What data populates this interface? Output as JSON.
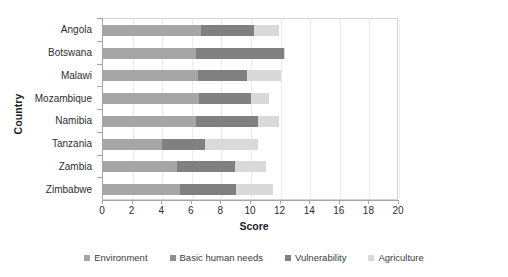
{
  "chart_data": {
    "type": "bar",
    "orientation": "horizontal",
    "stacked": true,
    "title": "",
    "xlabel": "Score",
    "ylabel": "Country",
    "xlim": [
      0,
      20
    ],
    "xticks": [
      0,
      2,
      4,
      6,
      8,
      10,
      12,
      14,
      16,
      18,
      20
    ],
    "grid": true,
    "legend_position": "bottom",
    "categories": [
      "Angola",
      "Botswana",
      "Malawi",
      "Mozambique",
      "Namibia",
      "Tanzania",
      "Zambia",
      "Zimbabwe"
    ],
    "series": [
      {
        "name": "Environment",
        "color": "#a6a6a6",
        "values": [
          6.6,
          6.3,
          6.4,
          6.5,
          6.3,
          4.0,
          5.0,
          5.2
        ]
      },
      {
        "name": "Basic human needs",
        "color": "#8f8f8f",
        "values": [
          0.0,
          0.0,
          0.0,
          0.0,
          0.0,
          0.0,
          0.0,
          0.0
        ]
      },
      {
        "name": "Vulnerability",
        "color": "#808080",
        "values": [
          3.6,
          5.9,
          3.3,
          3.5,
          4.2,
          2.9,
          3.9,
          3.8
        ]
      },
      {
        "name": "Agriculture",
        "color": "#d9d9d9",
        "values": [
          1.7,
          0.1,
          2.3,
          1.2,
          1.4,
          3.6,
          2.1,
          2.5
        ]
      }
    ],
    "totals": [
      11.9,
      12.3,
      12.0,
      11.2,
      11.9,
      10.5,
      11.0,
      11.5
    ]
  },
  "axis": {
    "x_title": "Score",
    "y_title": "Country"
  },
  "legend": {
    "items": [
      {
        "label": "Environment",
        "color": "#a6a6a6"
      },
      {
        "label": "Basic human needs",
        "color": "#8f8f8f"
      },
      {
        "label": "Vulnerability",
        "color": "#808080"
      },
      {
        "label": "Agriculture",
        "color": "#d9d9d9"
      }
    ]
  }
}
